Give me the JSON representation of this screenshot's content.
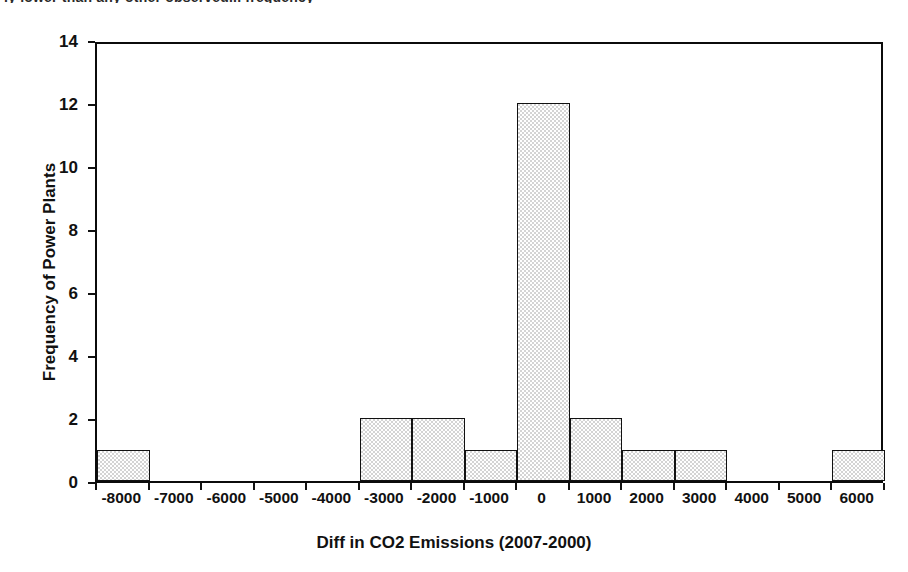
{
  "figure": {
    "cut_off_caption": "ly lower than any other observed... frequency"
  },
  "chart_data": {
    "type": "bar",
    "title": "",
    "subtitle": "",
    "xlabel": "Diff in CO2 Emissions (2007-2000)",
    "ylabel": "Frequency of Power Plants",
    "categories": [
      "-8000",
      "-7000",
      "-6000",
      "-5000",
      "-4000",
      "-3000",
      "-2000",
      "-1000",
      "0",
      "1000",
      "2000",
      "3000",
      "4000",
      "5000",
      "6000"
    ],
    "values": [
      1,
      0,
      0,
      0,
      0,
      2,
      2,
      1,
      12,
      2,
      1,
      1,
      0,
      0,
      1
    ],
    "xtick_labels": [
      "-8000",
      "-7000",
      "-6000",
      "-5000",
      "-4000",
      "-3000",
      "-2000",
      "-1000",
      "0",
      "1000",
      "2000",
      "3000",
      "4000",
      "5000",
      "6000"
    ],
    "ytick_labels": [
      "0",
      "2",
      "4",
      "6",
      "8",
      "10",
      "12",
      "14"
    ],
    "ytick_values": [
      0,
      2,
      4,
      6,
      8,
      10,
      12,
      14
    ],
    "ylim": [
      0,
      14
    ],
    "grid": false,
    "legend": false,
    "legend_position": "none",
    "bar_fill_color": "#d4d4d4",
    "bar_edge_color": "#111111",
    "axis_color": "#0b0b0b",
    "background_color": "#ffffff",
    "series": [
      {
        "name": "Frequency of Power Plants",
        "values": [
          1,
          0,
          0,
          0,
          0,
          2,
          2,
          1,
          12,
          2,
          1,
          1,
          0,
          0,
          1
        ]
      }
    ]
  }
}
